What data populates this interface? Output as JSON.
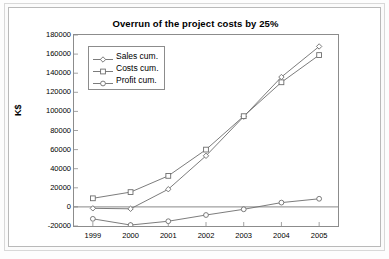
{
  "chart_data": {
    "type": "line",
    "title": "Overrun of the project costs by 25%",
    "xlabel": "",
    "ylabel": "K$",
    "categories": [
      "1999",
      "2000",
      "2001",
      "2002",
      "2003",
      "2004",
      "2005"
    ],
    "ylim": [
      -20000,
      180000
    ],
    "ytick_step": 20000,
    "yticks": [
      "180000",
      "160000",
      "140000",
      "120000",
      "100000",
      "80000",
      "60000",
      "40000",
      "20000",
      "0",
      "-20000"
    ],
    "ytick_values": [
      180000,
      160000,
      140000,
      120000,
      100000,
      80000,
      60000,
      40000,
      20000,
      0,
      -20000
    ],
    "grid": false,
    "zero_line": true,
    "legend_position": "top-left",
    "series": [
      {
        "name": "Sales cum.",
        "marker": "diamond",
        "color": "#6d6d6d",
        "values": [
          -1500,
          -2000,
          18500,
          53500,
          94500,
          136000,
          168000
        ]
      },
      {
        "name": "Costs cum.",
        "marker": "square",
        "color": "#6d6d6d",
        "values": [
          9000,
          15500,
          32500,
          60000,
          95000,
          130500,
          159000
        ]
      },
      {
        "name": "Profit cum.",
        "marker": "circle",
        "color": "#6d6d6d",
        "values": [
          -12500,
          -19000,
          -15000,
          -8500,
          -2500,
          4500,
          8500
        ]
      }
    ]
  }
}
